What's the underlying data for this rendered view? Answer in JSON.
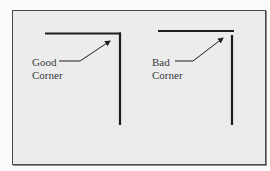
{
  "diagram": {
    "panels": [
      {
        "id": "good",
        "label_line1": "Good",
        "label_line2": "Corner"
      },
      {
        "id": "bad",
        "label_line1": "Bad",
        "label_line2": "Corner"
      }
    ],
    "colors": {
      "line": "#1e1e1e",
      "background": "#ececec",
      "border": "#4a4a4a",
      "text": "#3a3a3a"
    }
  }
}
